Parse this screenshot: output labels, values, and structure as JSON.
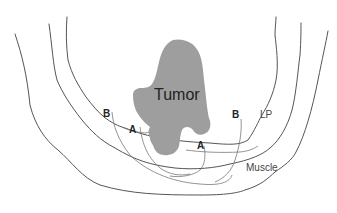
{
  "diagram": {
    "labels": {
      "tumor": "Tumor",
      "a_left": "A",
      "a_right": "A",
      "b_left": "B",
      "b_right": "B",
      "lp": "LP",
      "muscle": "Muscle"
    },
    "layers": [
      "Lamina propria (LP)",
      "Muscle",
      "Outer wall"
    ],
    "colors": {
      "tumor_fill": "#9e9e9e",
      "line": "#555555",
      "background": "#ffffff"
    }
  }
}
